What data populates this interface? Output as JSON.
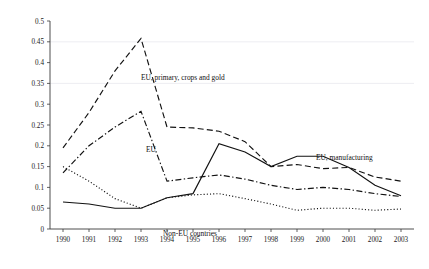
{
  "chart_data": {
    "type": "line",
    "title": "",
    "subtitle": "",
    "xlabel": "",
    "ylabel": "",
    "categories": [
      "1990",
      "1991",
      "1992",
      "1993",
      "1994",
      "1995",
      "1996",
      "1997",
      "1998",
      "1999",
      "2000",
      "2001",
      "2002",
      "2003"
    ],
    "x": [
      1990,
      1991,
      1992,
      1993,
      1994,
      1995,
      1996,
      1997,
      1998,
      1999,
      2000,
      2001,
      2002,
      2003
    ],
    "ylim": [
      0,
      0.5
    ],
    "xlim": [
      1990,
      2003
    ],
    "yticks": [
      0,
      0.05,
      0.1,
      0.15,
      0.2,
      0.25,
      0.3,
      0.35,
      0.4,
      0.45,
      0.5
    ],
    "ytick_labels": [
      "0",
      "0.05",
      "0.1",
      "0.15",
      "0.2",
      "0.25",
      "0.3",
      "0.35",
      "0.4",
      "0.45",
      "0.5"
    ],
    "grid": false,
    "legend_position": "inline-annotations",
    "series": [
      {
        "name": "EU, primary, crops and gold",
        "style": "dashed",
        "color": "#121212",
        "values": [
          0.195,
          0.28,
          0.38,
          0.458,
          0.245,
          0.243,
          0.235,
          0.21,
          0.15,
          0.155,
          0.145,
          0.148,
          0.125,
          0.115
        ]
      },
      {
        "name": "EU",
        "style": "dash-dot",
        "color": "#121212",
        "values": [
          0.135,
          0.2,
          0.245,
          0.283,
          0.115,
          0.123,
          0.13,
          0.12,
          0.105,
          0.095,
          0.1,
          0.095,
          0.085,
          0.078
        ]
      },
      {
        "name": "EU, manufacturing",
        "style": "solid",
        "color": "#121212",
        "values": [
          0.065,
          0.06,
          0.05,
          0.05,
          0.075,
          0.085,
          0.205,
          0.185,
          0.15,
          0.175,
          0.175,
          0.148,
          0.105,
          0.08
        ]
      },
      {
        "name": "Non-EU countries",
        "style": "dotted",
        "color": "#121212",
        "values": [
          0.15,
          0.115,
          0.073,
          0.05,
          0.075,
          0.082,
          0.085,
          0.073,
          0.06,
          0.045,
          0.05,
          0.05,
          0.045,
          0.048
        ]
      }
    ],
    "annotations": [
      {
        "text": "EU, primary, crops and gold",
        "x": 141,
        "y": 80,
        "series": "EU, primary, crops and gold"
      },
      {
        "text": "EU",
        "x": 146,
        "y": 152,
        "series": "EU"
      },
      {
        "text": "EU, manufacturing",
        "x": 316,
        "y": 160,
        "series": "EU, manufacturing"
      },
      {
        "text": "Non-EU countries",
        "x": 163,
        "y": 236,
        "series": "Non-EU countries"
      }
    ]
  }
}
